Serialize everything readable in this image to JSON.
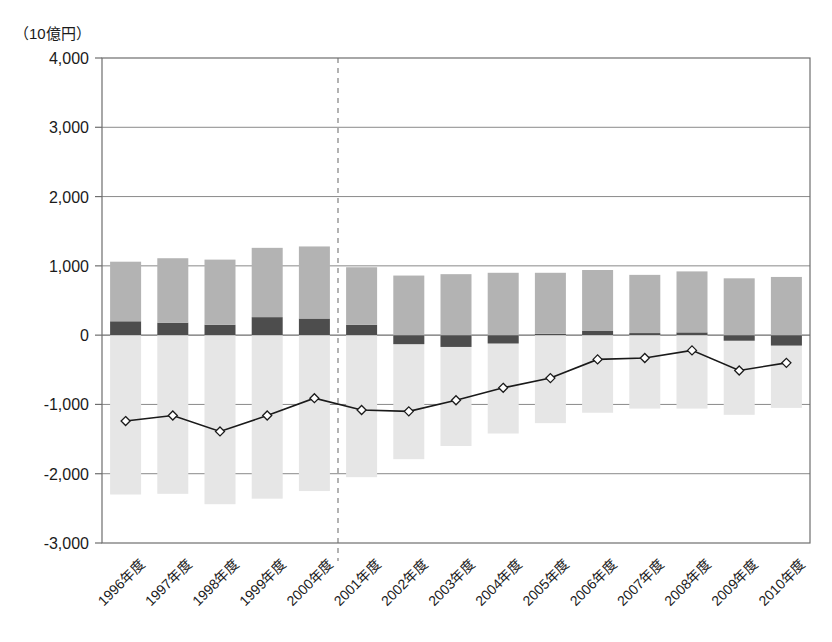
{
  "chart_data": {
    "type": "bar",
    "title": "",
    "subtitle": "",
    "unit_label": "（10億円）",
    "xlabel": "",
    "ylabel": "",
    "ylim": [
      -3000,
      4000
    ],
    "ytick_step": 1000,
    "ytick_labels": [
      "4,000",
      "3,000",
      "2,000",
      "1,000",
      "0",
      "-1,000",
      "-2,000",
      "-3,000"
    ],
    "ytick_values": [
      4000,
      3000,
      2000,
      1000,
      0,
      -1000,
      -2000,
      -3000
    ],
    "grid": true,
    "legend_position": "none",
    "stacked": true,
    "categories": [
      "1996年度",
      "1997年度",
      "1998年度",
      "1999年度",
      "2000年度",
      "2001年度",
      "2002年度",
      "2003年度",
      "2004年度",
      "2005年度",
      "2006年度",
      "2007年度",
      "2008年度",
      "2009年度",
      "2010年度"
    ],
    "series": [
      {
        "name": "light-gray-positive",
        "color": "#b3b3b3",
        "values": [
          860,
          930,
          940,
          1000,
          1040,
          830,
          860,
          880,
          900,
          880,
          880,
          840,
          880,
          820,
          840
        ]
      },
      {
        "name": "dark-gray",
        "color": "#4d4d4d",
        "values": [
          200,
          180,
          150,
          260,
          240,
          150,
          -130,
          -170,
          -120,
          20,
          60,
          30,
          40,
          -80,
          -150
        ]
      },
      {
        "name": "pale-gray-negative",
        "color": "#e6e6e6",
        "values": [
          -2300,
          -2290,
          -2440,
          -2360,
          -2250,
          -2050,
          -1790,
          -1600,
          -1420,
          -1270,
          -1120,
          -1060,
          -1060,
          -1150,
          -1050
        ]
      }
    ],
    "line_series": {
      "name": "net-balance-line",
      "color": "#1a1a1a",
      "marker": "open-diamond",
      "values": [
        -1240,
        -1160,
        -1390,
        -1160,
        -910,
        -1080,
        -1100,
        -940,
        -760,
        -620,
        -350,
        -330,
        -220,
        -510,
        -400
      ]
    },
    "annotations": [
      {
        "name": "forecast-divider",
        "type": "vertical-dashed-line",
        "after_category": "2000年度"
      }
    ]
  }
}
